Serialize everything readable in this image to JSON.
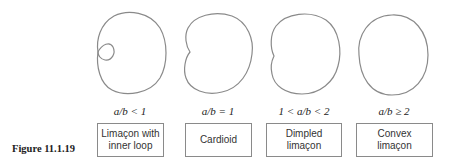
{
  "figure": {
    "label": "Figure 11.1.19"
  },
  "colors": {
    "curve_stroke": "#8a8a8a",
    "box_border": "#8a8a8a",
    "text": "#222222"
  },
  "panels": [
    {
      "id": "inner-loop",
      "condition": "a/b < 1",
      "name_line1": "Limaçon with",
      "name_line2": "inner loop"
    },
    {
      "id": "cardioid",
      "condition": "a/b = 1",
      "name_line1": "Cardioid",
      "name_line2": ""
    },
    {
      "id": "dimpled",
      "condition": "1 < a/b < 2",
      "name_line1": "Dimpled limaçon",
      "name_line2": ""
    },
    {
      "id": "convex",
      "condition": "a/b ≥ 2",
      "name_line1": "Convex limaçon",
      "name_line2": ""
    }
  ]
}
